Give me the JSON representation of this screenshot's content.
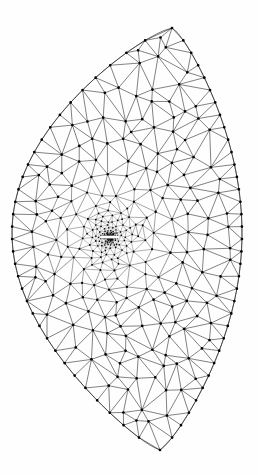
{
  "figure": {
    "domain_shape": "lens",
    "background_color": "#fefefe",
    "edge_color": "#1a1a1a",
    "node_color": "#000000",
    "caption": ""
  },
  "chart_data": {
    "type": "diagram",
    "subtype": "triangular-finite-element-mesh",
    "xlabel": "",
    "ylabel": "",
    "xlim": [
      0,
      258
    ],
    "ylim": [
      0,
      475
    ],
    "grid": false,
    "legend": "none",
    "annotations": [],
    "boundary": {
      "name": "lens-shaped outer boundary",
      "top_apex": [
        172,
        28
      ],
      "bottom_apex": [
        160,
        450
      ],
      "left_extreme": [
        12,
        241
      ],
      "right_extreme": [
        242,
        233
      ],
      "left_arc_bulge": 1.0,
      "right_arc_bulge": 1.0
    },
    "crack": {
      "name": "central horizontal slit",
      "center": [
        110,
        237
      ],
      "half_length": 9,
      "half_width": 1.6,
      "color": "#ffffff"
    },
    "refinement": {
      "center": [
        110,
        237
      ],
      "mode": "radial-graded",
      "rings": 26,
      "innermost_radius": 2.2,
      "outermost_radius": 190,
      "growth_rate": 1.235,
      "base_spacing_outer": 17,
      "min_spacing_inner": 0.7,
      "node_radius_inner": 0.45,
      "node_radius_outer": 1.35,
      "edge_width_inner": 0.17,
      "edge_width_outer": 0.55
    },
    "counts": {
      "approx_nodes": 1180,
      "approx_triangles": 2260,
      "approx_edges": 3430
    }
  }
}
